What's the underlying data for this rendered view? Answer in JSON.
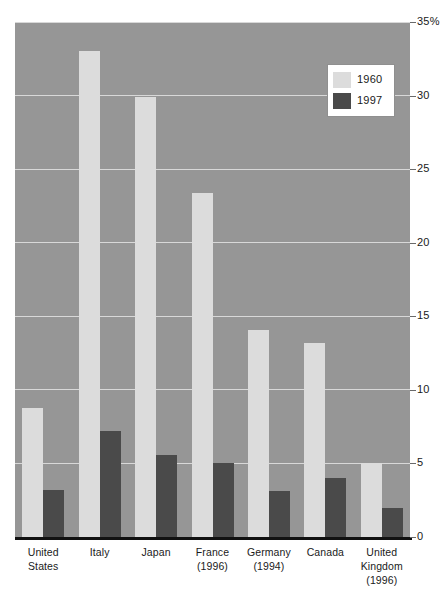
{
  "chart_data": {
    "type": "bar",
    "title": "",
    "subtitle": "",
    "xlabel": "",
    "ylabel": "",
    "ylim": [
      0,
      35
    ],
    "ytick_values": [
      0,
      5,
      10,
      15,
      20,
      25,
      30,
      35
    ],
    "ytick_labels": [
      "0",
      "5",
      "10",
      "15",
      "20",
      "25",
      "30",
      "35%"
    ],
    "grid": true,
    "legend_position": "top-right",
    "categories": [
      "United States",
      "Italy",
      "Japan",
      "France (1996)",
      "Germany (1994)",
      "Canada",
      "United Kingdom (1996)"
    ],
    "category_lines": [
      [
        "United",
        "States"
      ],
      [
        "Italy"
      ],
      [
        "Japan"
      ],
      [
        "France",
        "(1996)"
      ],
      [
        "Germany",
        "(1994)"
      ],
      [
        "Canada"
      ],
      [
        "United",
        "Kingdom",
        "(1996)"
      ]
    ],
    "series": [
      {
        "name": "1960",
        "color": "#dcdcdc",
        "values": [
          8.8,
          33.0,
          29.9,
          23.4,
          14.1,
          13.2,
          5.0
        ]
      },
      {
        "name": "1997",
        "color": "#4a4a4a",
        "values": [
          3.2,
          7.2,
          5.6,
          5.0,
          3.1,
          4.0,
          2.0
        ]
      }
    ]
  },
  "legend": {
    "items": [
      {
        "label": "1960",
        "swatch": "y1960"
      },
      {
        "label": "1997",
        "swatch": "y1997"
      }
    ]
  },
  "colors": {
    "plot_background": "#969696",
    "gridline": "#d8d8d8",
    "baseline": "#111111",
    "bar_1960": "#dcdcdc",
    "bar_1997": "#4a4a4a",
    "text": "#1a1a1a",
    "page_background": "#ffffff"
  }
}
